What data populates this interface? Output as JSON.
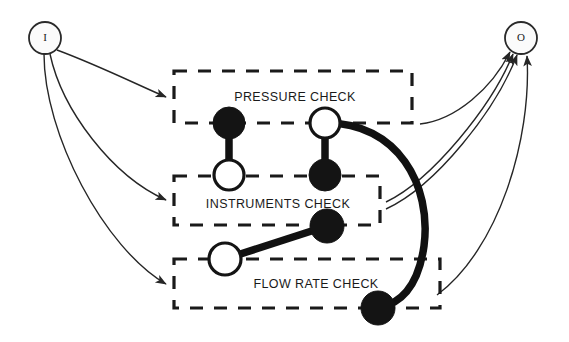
{
  "diagram": {
    "type": "petri-net-process-diagram",
    "canvas": {
      "width": 569,
      "height": 342,
      "background": "#ffffff"
    },
    "terminals": {
      "input": {
        "label": "I",
        "name": "input-terminal",
        "cx": 45,
        "cy": 38,
        "r": 16
      },
      "output": {
        "label": "O",
        "name": "output-terminal",
        "cx": 521,
        "cy": 38,
        "r": 16
      }
    },
    "subnets": [
      {
        "id": "pressure-check",
        "label": "PRESSURE CHECK",
        "label_x": 295,
        "label_y": 98,
        "box": {
          "x": 174,
          "y": 71,
          "width": 238,
          "height": 52
        }
      },
      {
        "id": "instruments-check",
        "label": "INSTRUMENTS CHECK",
        "label_x": 278,
        "label_y": 205,
        "box": {
          "x": 174,
          "y": 176,
          "width": 206,
          "height": 49
        }
      },
      {
        "id": "flow-rate-check",
        "label": "FLOW RATE CHECK",
        "label_x": 316,
        "label_y": 285,
        "box": {
          "x": 174,
          "y": 259,
          "width": 266,
          "height": 49
        }
      }
    ],
    "nodes": [
      {
        "id": "n1",
        "kind": "filled",
        "cx": 229,
        "cy": 123,
        "r": 16
      },
      {
        "id": "n2",
        "kind": "open",
        "cx": 229,
        "cy": 175,
        "r": 15
      },
      {
        "id": "n3",
        "kind": "open",
        "cx": 325,
        "cy": 123,
        "r": 15
      },
      {
        "id": "n4",
        "kind": "filled",
        "cx": 325,
        "cy": 175,
        "r": 16
      },
      {
        "id": "n5",
        "kind": "filled",
        "cx": 327,
        "cy": 226,
        "r": 17
      },
      {
        "id": "n6",
        "kind": "open",
        "cx": 225,
        "cy": 259,
        "r": 16
      },
      {
        "id": "n7",
        "kind": "filled",
        "cx": 378,
        "cy": 308,
        "r": 17
      }
    ],
    "internal_links": [
      {
        "from": "n1",
        "to": "n2",
        "style": "thick-bar"
      },
      {
        "from": "n3",
        "to": "n4",
        "style": "thick-bar"
      },
      {
        "from": "n5",
        "to": "n6",
        "style": "thick-bar"
      },
      {
        "from": "n3",
        "to": "n7",
        "style": "thick-arc"
      }
    ],
    "input_edges": [
      {
        "name": "input-to-pressure-check",
        "target": "pressure-check"
      },
      {
        "name": "input-to-instruments-check",
        "target": "instruments-check"
      },
      {
        "name": "input-to-flow-rate-check",
        "target": "flow-rate-check"
      }
    ],
    "output_edges": [
      {
        "name": "pressure-check-to-output",
        "source": "pressure-check"
      },
      {
        "name": "instruments-check-to-output-a",
        "source": "instruments-check"
      },
      {
        "name": "instruments-check-to-output-b",
        "source": "instruments-check"
      },
      {
        "name": "flow-rate-check-to-output",
        "source": "flow-rate-check"
      }
    ]
  }
}
